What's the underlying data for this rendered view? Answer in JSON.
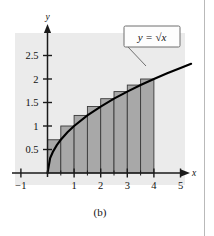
{
  "figure": {
    "caption": "(b)",
    "equation_label": "y = √x",
    "axis_x_name": "x",
    "axis_y_name": "y",
    "plot_bg_color": "#ebebeb",
    "bar_fill_color": "#a8a8a8",
    "bar_stroke_color": "#3a3a3a",
    "curve_color": "#000000",
    "axis_color": "#1a1a1a",
    "label_box_bg": "#fdfdfd",
    "label_box_border": "#6f6f6f"
  },
  "chart_data": {
    "type": "area",
    "title": "",
    "subtitle": "",
    "xlabel": "x",
    "ylabel": "y",
    "xlim": [
      -1.35,
      5.75
    ],
    "ylim": [
      -0.35,
      2.95
    ],
    "grid": false,
    "legend_position": "inside-top-right",
    "function": "y = sqrt(x)",
    "annotations": [
      {
        "text": "y = √x",
        "x": 3.55,
        "y": 2.62,
        "style": "boxed-callout",
        "points_to": {
          "x": 3.6,
          "y": 1.897
        }
      }
    ],
    "xticks": [
      -1,
      1,
      2,
      3,
      4,
      5
    ],
    "xtick_labels": [
      "−1",
      "1",
      "2",
      "3",
      "4",
      "5"
    ],
    "yticks": [
      0.5,
      1,
      1.5,
      2,
      2.5
    ],
    "ytick_labels": [
      "0.5",
      "1",
      "1.5",
      "2",
      "2.5"
    ],
    "minor_xticks": [
      0.5,
      1.5,
      2.5,
      3.5
    ],
    "riemann": {
      "rule": "right-endpoint",
      "n": 8,
      "a": 0,
      "b": 4,
      "dx": 0.5,
      "bar_left_edges": [
        0,
        0.5,
        1,
        1.5,
        2,
        2.5,
        3,
        3.5
      ],
      "bar_right_edges": [
        0.5,
        1,
        1.5,
        2,
        2.5,
        3,
        3.5,
        4
      ],
      "bar_heights": [
        0.707,
        1.0,
        1.225,
        1.414,
        1.581,
        1.732,
        1.871,
        2.0
      ]
    },
    "curve_points_x": [
      0,
      0.1,
      0.2,
      0.35,
      0.5,
      0.75,
      1,
      1.5,
      2,
      2.5,
      3,
      3.5,
      4,
      4.5,
      5,
      5.4
    ],
    "curve_points_y": [
      0,
      0.316,
      0.447,
      0.592,
      0.707,
      0.866,
      1.0,
      1.225,
      1.414,
      1.581,
      1.732,
      1.871,
      2.0,
      2.121,
      2.236,
      2.324
    ]
  }
}
